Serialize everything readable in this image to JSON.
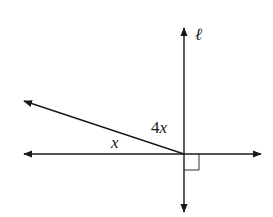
{
  "figure": {
    "type": "geometry-angle-diagram",
    "line_label": "ℓ",
    "angle_labels": {
      "small_angle": "x",
      "upper_angle_coef": "4",
      "upper_angle_var": "x"
    },
    "right_angle_marker": true,
    "colors": {
      "stroke": "#1a1a1a",
      "background": "#ffffff"
    }
  }
}
